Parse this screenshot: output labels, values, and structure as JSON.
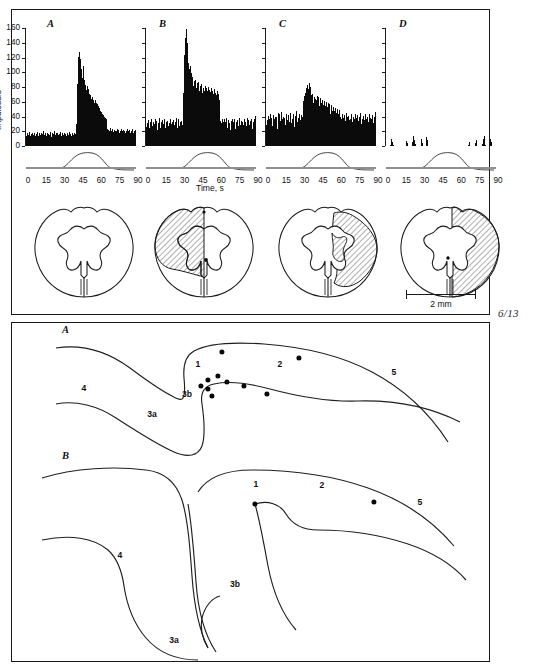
{
  "figure": {
    "folio": "6/13",
    "scalebar_label": "2 mm"
  },
  "histograms": {
    "y_axis_title": "Impulses/s",
    "x_axis_title": "Time, s",
    "y_ticks": [
      "0",
      "20",
      "40",
      "60",
      "80",
      "100",
      "120",
      "140",
      "160"
    ],
    "x_ticks": [
      "0",
      "15",
      "30",
      "45",
      "60",
      "75",
      "90"
    ],
    "panels": [
      {
        "letter": "A"
      },
      {
        "letter": "B"
      },
      {
        "letter": "C"
      },
      {
        "letter": "D"
      }
    ]
  },
  "chart_data": [
    {
      "type": "bar",
      "title": "A",
      "xlabel": "Time, s",
      "ylabel": "Impulses/s",
      "xlim": [
        0,
        90
      ],
      "ylim": [
        0,
        160
      ],
      "x_ticks": [
        0,
        15,
        30,
        45,
        60,
        75,
        90
      ],
      "y_ticks": [
        0,
        20,
        40,
        60,
        80,
        100,
        120,
        140,
        160
      ],
      "grid": false,
      "legend": "none",
      "bin_width_s": 0.9,
      "values": [
        14,
        11,
        17,
        9,
        15,
        12,
        19,
        10,
        13,
        16,
        9,
        14,
        18,
        11,
        15,
        10,
        17,
        13,
        8,
        16,
        12,
        19,
        11,
        14,
        9,
        17,
        13,
        15,
        10,
        18,
        12,
        16,
        9,
        14,
        20,
        11,
        15,
        13,
        17,
        10,
        14,
        12,
        18,
        11,
        16,
        9,
        15,
        13,
        19,
        12,
        10,
        17,
        14,
        11,
        16,
        20,
        13,
        15,
        9,
        17,
        12,
        14,
        18,
        11,
        15,
        10,
        16,
        13,
        19,
        12,
        14,
        17,
        11,
        9,
        15,
        13,
        18,
        10,
        16,
        12,
        14,
        11,
        17,
        13,
        15,
        9,
        19,
        12,
        16,
        10,
        14,
        18,
        11,
        15,
        13,
        17,
        9,
        12,
        16,
        14,
        30,
        62,
        84,
        105,
        121,
        112,
        127,
        118,
        99,
        104,
        96,
        88,
        92,
        108,
        97,
        84,
        90,
        79,
        83,
        76,
        72,
        81,
        68,
        74,
        77,
        66,
        71,
        63,
        69,
        58,
        64,
        60,
        66,
        57,
        62,
        55,
        59,
        63,
        54,
        58,
        52,
        57,
        49,
        54,
        47,
        51,
        44,
        48,
        42,
        46,
        40,
        44,
        38,
        42,
        36,
        40,
        34,
        38,
        32,
        36,
        21,
        19,
        23,
        17,
        22,
        16,
        20,
        18,
        24,
        15,
        21,
        17,
        23,
        19,
        16,
        22,
        18,
        20,
        15,
        21,
        17,
        23,
        19,
        16,
        22,
        18,
        14,
        20,
        17,
        23,
        15,
        21,
        19,
        16,
        22,
        18,
        20,
        14,
        17,
        21,
        19,
        15,
        23,
        16,
        20,
        18,
        22,
        14,
        17,
        21,
        15,
        19,
        23,
        16,
        18,
        20,
        14,
        22,
        17,
        15
      ]
    },
    {
      "type": "bar",
      "title": "B",
      "xlabel": "Time, s",
      "ylabel": "Impulses/s",
      "xlim": [
        0,
        90
      ],
      "ylim": [
        0,
        160
      ],
      "x_ticks": [
        0,
        15,
        30,
        45,
        60,
        75,
        90
      ],
      "y_ticks": [
        0,
        20,
        40,
        60,
        80,
        100,
        120,
        140,
        160
      ],
      "grid": false,
      "legend": "none",
      "bin_width_s": 0.9,
      "values": [
        26,
        31,
        22,
        35,
        28,
        24,
        33,
        29,
        21,
        37,
        27,
        32,
        25,
        30,
        23,
        36,
        28,
        34,
        22,
        29,
        31,
        26,
        38,
        24,
        33,
        27,
        35,
        22,
        30,
        28,
        36,
        25,
        32,
        29,
        23,
        34,
        27,
        31,
        26,
        37,
        24,
        30,
        33,
        27,
        22,
        35,
        29,
        32,
        26,
        38,
        28,
        24,
        31,
        36,
        27,
        33,
        25,
        30,
        34,
        28,
        46,
        72,
        98,
        124,
        147,
        158,
        152,
        140,
        126,
        112,
        104,
        96,
        108,
        92,
        99,
        86,
        94,
        81,
        88,
        76,
        83,
        90,
        78,
        85,
        73,
        80,
        87,
        75,
        82,
        70,
        77,
        84,
        72,
        79,
        68,
        75,
        81,
        71,
        78,
        69,
        74,
        80,
        70,
        76,
        67,
        73,
        79,
        68,
        75,
        65,
        71,
        77,
        66,
        72,
        63,
        69,
        74,
        64,
        70,
        62,
        29,
        34,
        25,
        31,
        37,
        27,
        33,
        23,
        36,
        28,
        32,
        26,
        38,
        24,
        30,
        35,
        27,
        31,
        22,
        34,
        28,
        36,
        25,
        32,
        29,
        37,
        23,
        30,
        33,
        26,
        35,
        27,
        31,
        38,
        24,
        29,
        34,
        26,
        32,
        28,
        36,
        25,
        30,
        33,
        27,
        38,
        24,
        31,
        35,
        28,
        26,
        34,
        29,
        37,
        23,
        32,
        30,
        36,
        27,
        41
      ]
    },
    {
      "type": "bar",
      "title": "C",
      "xlabel": "Time, s",
      "ylabel": "Impulses/s",
      "xlim": [
        0,
        90
      ],
      "ylim": [
        0,
        160
      ],
      "x_ticks": [
        0,
        15,
        30,
        45,
        60,
        75,
        90
      ],
      "y_ticks": [
        0,
        20,
        40,
        60,
        80,
        100,
        120,
        140,
        160
      ],
      "grid": false,
      "legend": "none",
      "bin_width_s": 0.9,
      "values": [
        28,
        35,
        24,
        41,
        30,
        37,
        26,
        44,
        32,
        38,
        27,
        42,
        29,
        36,
        25,
        40,
        33,
        39,
        23,
        45,
        31,
        27,
        43,
        34,
        29,
        46,
        36,
        25,
        40,
        32,
        38,
        28,
        44,
        30,
        35,
        26,
        42,
        33,
        27,
        39,
        45,
        31,
        37,
        29,
        43,
        34,
        26,
        41,
        36,
        30,
        47,
        32,
        38,
        25,
        44,
        35,
        28,
        42,
        31,
        39,
        52,
        61,
        55,
        68,
        72,
        66,
        79,
        74,
        83,
        77,
        71,
        86,
        80,
        75,
        69,
        63,
        70,
        58,
        66,
        60,
        64,
        57,
        62,
        68,
        55,
        61,
        66,
        54,
        59,
        65,
        52,
        58,
        63,
        50,
        56,
        61,
        48,
        54,
        60,
        47,
        53,
        58,
        45,
        51,
        57,
        44,
        50,
        55,
        42,
        48,
        53,
        41,
        47,
        52,
        39,
        45,
        50,
        38,
        44,
        49,
        33,
        40,
        29,
        36,
        43,
        31,
        38,
        26,
        42,
        34,
        30,
        45,
        32,
        39,
        27,
        41,
        35,
        28,
        37,
        30,
        43,
        33,
        26,
        40,
        36,
        29,
        44,
        31,
        38,
        25,
        42,
        34,
        27,
        39,
        32,
        45,
        30,
        36,
        28,
        41,
        35,
        29,
        43,
        31,
        37,
        26,
        40,
        33,
        28,
        44,
        30,
        38,
        25,
        36,
        42,
        31,
        27,
        39,
        34,
        46
      ]
    },
    {
      "type": "bar",
      "title": "D",
      "xlabel": "Time, s",
      "ylabel": "Impulses/s",
      "xlim": [
        0,
        90
      ],
      "ylim": [
        0,
        160
      ],
      "x_ticks": [
        0,
        15,
        30,
        45,
        60,
        75,
        90
      ],
      "y_ticks": [
        0,
        20,
        40,
        60,
        80,
        100,
        120,
        140,
        160
      ],
      "grid": false,
      "legend": "none",
      "bin_width_s": 0.9,
      "values": [
        0,
        0,
        0,
        0,
        0,
        0,
        0,
        2,
        5,
        9,
        6,
        2,
        0,
        0,
        0,
        0,
        0,
        0,
        0,
        0,
        0,
        0,
        0,
        0,
        0,
        0,
        0,
        0,
        0,
        0,
        0,
        0,
        3,
        7,
        4,
        0,
        0,
        0,
        0,
        0,
        0,
        0,
        2,
        6,
        11,
        14,
        8,
        3,
        0,
        0,
        0,
        0,
        0,
        0,
        0,
        0,
        0,
        5,
        9,
        4,
        0,
        0,
        0,
        0,
        0,
        0,
        12,
        8,
        3,
        0,
        0,
        0,
        0,
        0,
        0,
        0,
        0,
        0,
        0,
        0,
        0,
        0,
        0,
        0,
        0,
        0,
        0,
        0,
        0,
        0,
        0,
        0,
        0,
        0,
        0,
        0,
        0,
        0,
        0,
        0,
        0,
        0,
        0,
        0,
        0,
        0,
        0,
        0,
        0,
        0,
        0,
        0,
        0,
        0,
        0,
        0,
        0,
        0,
        0,
        0,
        0,
        0,
        0,
        0,
        0,
        0,
        0,
        0,
        0,
        0,
        0,
        0,
        0,
        0,
        0,
        2,
        5,
        3,
        0,
        0,
        0,
        0,
        0,
        0,
        0,
        0,
        4,
        8,
        5,
        0,
        0,
        0,
        0,
        0,
        0,
        0,
        0,
        0,
        3,
        9,
        13,
        7,
        2,
        0,
        0,
        0,
        0,
        0,
        0,
        0,
        4,
        10,
        6,
        2,
        0,
        0,
        0,
        0,
        0,
        0
      ]
    }
  ],
  "cord_sections": [
    {
      "name": "section-intact",
      "lesion": "none"
    },
    {
      "name": "section-dorsal-quadrant-lesion",
      "lesion": "left-dorsal-quadrant"
    },
    {
      "name": "section-lateral-lesion",
      "lesion": "right-dorsolateral"
    },
    {
      "name": "section-hemisection",
      "lesion": "right-hemisection"
    }
  ],
  "cortical_maps": [
    {
      "letter": "A",
      "areas": [
        {
          "label": "4",
          "x": 72,
          "y": 62
        },
        {
          "label": "3a",
          "x": 140,
          "y": 88
        },
        {
          "label": "3b",
          "x": 175,
          "y": 68
        },
        {
          "label": "1",
          "x": 186,
          "y": 38
        },
        {
          "label": "2",
          "x": 268,
          "y": 38
        },
        {
          "label": "5",
          "x": 382,
          "y": 46
        }
      ],
      "recording_sites": [
        {
          "x": 210,
          "y": 26
        },
        {
          "x": 287,
          "y": 32
        },
        {
          "x": 196,
          "y": 54
        },
        {
          "x": 206,
          "y": 50
        },
        {
          "x": 215,
          "y": 56
        },
        {
          "x": 189,
          "y": 60
        },
        {
          "x": 196,
          "y": 63
        },
        {
          "x": 200,
          "y": 70
        },
        {
          "x": 232,
          "y": 60
        },
        {
          "x": 255,
          "y": 68
        }
      ]
    },
    {
      "letter": "B",
      "areas": [
        {
          "label": "4",
          "x": 108,
          "y": 103
        },
        {
          "label": "3a",
          "x": 162,
          "y": 188
        },
        {
          "label": "3b",
          "x": 223,
          "y": 132
        },
        {
          "label": "1",
          "x": 244,
          "y": 32
        },
        {
          "label": "2",
          "x": 310,
          "y": 33
        },
        {
          "label": "5",
          "x": 408,
          "y": 50
        }
      ],
      "recording_sites": [
        {
          "x": 243,
          "y": 52
        },
        {
          "x": 362,
          "y": 50
        }
      ]
    }
  ]
}
